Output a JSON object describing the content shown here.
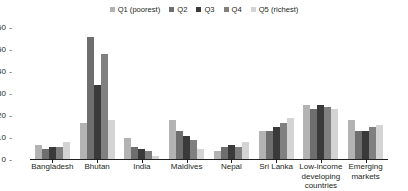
{
  "legend": {
    "items": [
      {
        "label": "Q1 (poorest)",
        "color": "#b3b3b3"
      },
      {
        "label": "Q2",
        "color": "#6e6e6e"
      },
      {
        "label": "Q3",
        "color": "#3a3a3a"
      },
      {
        "label": "Q4",
        "color": "#808080"
      },
      {
        "label": "Q5 (richest)",
        "color": "#d4d4d4"
      }
    ]
  },
  "axis": {
    "yticks": [
      "0",
      "10",
      "20",
      "30",
      "40",
      "50",
      "60"
    ],
    "dash": "-"
  },
  "chart_data": {
    "type": "bar",
    "title": "",
    "subtitle": "",
    "xlabel": "",
    "ylabel": "",
    "ylim": [
      0,
      60
    ],
    "yticks": [
      0,
      10,
      20,
      30,
      40,
      50,
      60
    ],
    "grid": false,
    "legend_position": "top-center",
    "categories": [
      "Bangladesh",
      "Bhutan",
      "India",
      "Maldives",
      "Nepal",
      "Sri Lanka",
      "Low-income developing countries",
      "Emerging markets"
    ],
    "series": [
      {
        "name": "Q1 (poorest)",
        "color": "#b3b3b3",
        "values": [
          7,
          17,
          10,
          18,
          4,
          13,
          25,
          18
        ]
      },
      {
        "name": "Q2",
        "color": "#6e6e6e",
        "values": [
          5,
          56,
          6,
          13,
          6,
          13,
          23,
          13
        ]
      },
      {
        "name": "Q3",
        "color": "#3a3a3a",
        "values": [
          6,
          34,
          5,
          11,
          7,
          15,
          25,
          13
        ]
      },
      {
        "name": "Q4",
        "color": "#808080",
        "values": [
          6,
          48,
          4,
          9,
          6,
          17,
          24,
          15
        ]
      },
      {
        "name": "Q5 (richest)",
        "color": "#d4d4d4",
        "values": [
          8,
          18,
          2,
          5,
          8,
          19,
          23,
          16
        ]
      }
    ]
  },
  "xlabels": [
    {
      "line1": "Bangladesh",
      "line2": "",
      "line3": ""
    },
    {
      "line1": "Bhutan",
      "line2": "",
      "line3": ""
    },
    {
      "line1": "India",
      "line2": "",
      "line3": ""
    },
    {
      "line1": "Maldives",
      "line2": "",
      "line3": ""
    },
    {
      "line1": "Nepal",
      "line2": "",
      "line3": ""
    },
    {
      "line1": "Sri Lanka",
      "line2": "",
      "line3": ""
    },
    {
      "line1": "Low-income",
      "line2": "developing",
      "line3": "countries"
    },
    {
      "line1": "Emerging",
      "line2": "markets",
      "line3": ""
    }
  ]
}
